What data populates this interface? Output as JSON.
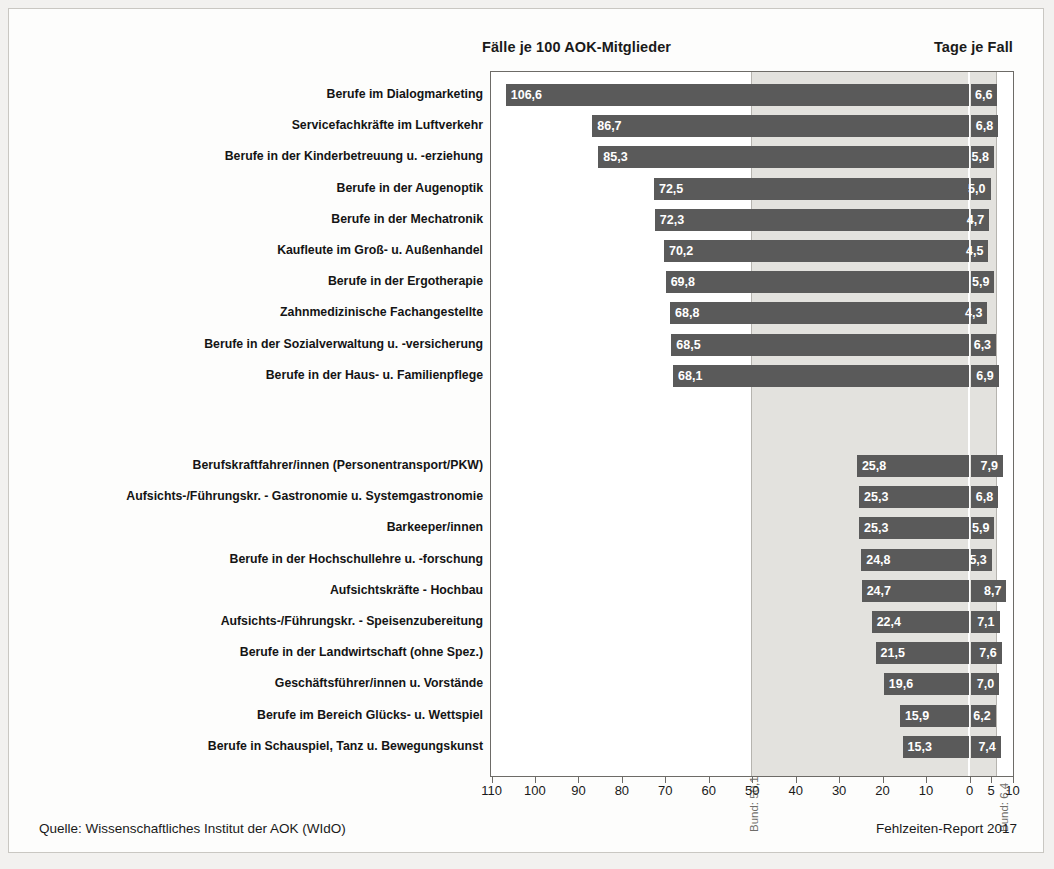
{
  "header": {
    "left_title": "Fälle je 100 AOK-Mitglieder",
    "right_title": "Tage je Fall"
  },
  "footer": {
    "source": "Quelle: Wissenschaftliches Institut der AOK (WIdO)",
    "report": "Fehlzeiten-Report 2017"
  },
  "reference": {
    "left_label": "Bund: 50,1",
    "right_label": "Bund: 6,4",
    "left_value": 50.1,
    "right_value": 6.4
  },
  "axis": {
    "left_ticks": [
      110,
      100,
      90,
      80,
      70,
      60,
      50,
      40,
      30,
      20,
      10,
      0
    ],
    "right_ticks": [
      5,
      10
    ],
    "left_labels": [
      "110",
      "100",
      "90",
      "80",
      "70",
      "60",
      "50",
      "40",
      "30",
      "20",
      "10",
      "0"
    ],
    "right_labels": [
      "5",
      "10"
    ],
    "left_max": 110,
    "right_max": 10
  },
  "chart_data": {
    "type": "bar",
    "xlabel": "",
    "ylabel": "",
    "orientation": "horizontal",
    "grid": false,
    "legend": "none",
    "axis_left_range": [
      110,
      0
    ],
    "axis_right_range": [
      0,
      10
    ],
    "reference_lines": {
      "Fälle je 100 AOK-Mitglieder": 50.1,
      "Tage je Fall": 6.4
    },
    "series": [
      {
        "name": "Fälle je 100 AOK-Mitglieder",
        "axis": "left"
      },
      {
        "name": "Tage je Fall",
        "axis": "right"
      }
    ],
    "groups": [
      {
        "name": "oben",
        "rows": [
          {
            "category": "Berufe im Dialogmarketing",
            "faelle": 106.6,
            "faelle_label": "106,6",
            "tage": 6.6,
            "tage_label": "6,6"
          },
          {
            "category": "Servicefachkräfte im Luftverkehr",
            "faelle": 86.7,
            "faelle_label": "86,7",
            "tage": 6.8,
            "tage_label": "6,8"
          },
          {
            "category": "Berufe in der Kinderbetreuung u. -erziehung",
            "faelle": 85.3,
            "faelle_label": "85,3",
            "tage": 5.8,
            "tage_label": "5,8"
          },
          {
            "category": "Berufe in der Augenoptik",
            "faelle": 72.5,
            "faelle_label": "72,5",
            "tage": 5.0,
            "tage_label": "5,0"
          },
          {
            "category": "Berufe in der Mechatronik",
            "faelle": 72.3,
            "faelle_label": "72,3",
            "tage": 4.7,
            "tage_label": "4,7"
          },
          {
            "category": "Kaufleute im Groß- u. Außenhandel",
            "faelle": 70.2,
            "faelle_label": "70,2",
            "tage": 4.5,
            "tage_label": "4,5"
          },
          {
            "category": "Berufe in der Ergotherapie",
            "faelle": 69.8,
            "faelle_label": "69,8",
            "tage": 5.9,
            "tage_label": "5,9"
          },
          {
            "category": "Zahnmedizinische Fachangestellte",
            "faelle": 68.8,
            "faelle_label": "68,8",
            "tage": 4.3,
            "tage_label": "4,3"
          },
          {
            "category": "Berufe in der Sozialverwaltung u. -versicherung",
            "faelle": 68.5,
            "faelle_label": "68,5",
            "tage": 6.3,
            "tage_label": "6,3"
          },
          {
            "category": "Berufe in der Haus- u. Familienpflege",
            "faelle": 68.1,
            "faelle_label": "68,1",
            "tage": 6.9,
            "tage_label": "6,9"
          }
        ]
      },
      {
        "name": "unten",
        "rows": [
          {
            "category": "Berufskraftfahrer/innen (Personentransport/PKW)",
            "faelle": 25.8,
            "faelle_label": "25,8",
            "tage": 7.9,
            "tage_label": "7,9"
          },
          {
            "category": "Aufsichts-/Führungskr. - Gastronomie u. Systemgastronomie",
            "faelle": 25.3,
            "faelle_label": "25,3",
            "tage": 6.8,
            "tage_label": "6,8"
          },
          {
            "category": "Barkeeper/innen",
            "faelle": 25.3,
            "faelle_label": "25,3",
            "tage": 5.9,
            "tage_label": "5,9"
          },
          {
            "category": "Berufe in der Hochschullehre u. -forschung",
            "faelle": 24.8,
            "faelle_label": "24,8",
            "tage": 5.3,
            "tage_label": "5,3"
          },
          {
            "category": "Aufsichtskräfte - Hochbau",
            "faelle": 24.7,
            "faelle_label": "24,7",
            "tage": 8.7,
            "tage_label": "8,7"
          },
          {
            "category": "Aufsichts-/Führungskr. - Speisenzubereitung",
            "faelle": 22.4,
            "faelle_label": "22,4",
            "tage": 7.1,
            "tage_label": "7,1"
          },
          {
            "category": "Berufe in der Landwirtschaft (ohne Spez.)",
            "faelle": 21.5,
            "faelle_label": "21,5",
            "tage": 7.6,
            "tage_label": "7,6"
          },
          {
            "category": "Geschäftsführer/innen u. Vorstände",
            "faelle": 19.6,
            "faelle_label": "19,6",
            "tage": 7.0,
            "tage_label": "7,0"
          },
          {
            "category": "Berufe im Bereich Glücks- u. Wettspiel",
            "faelle": 15.9,
            "faelle_label": "15,9",
            "tage": 6.2,
            "tage_label": "6,2"
          },
          {
            "category": "Berufe in Schauspiel, Tanz u. Bewegungskunst",
            "faelle": 15.3,
            "faelle_label": "15,3",
            "tage": 7.4,
            "tage_label": "7,4"
          }
        ]
      }
    ]
  }
}
